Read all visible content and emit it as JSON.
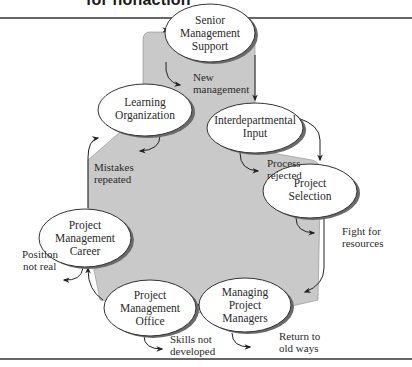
{
  "header": {
    "title_fragment": "for nonaction"
  },
  "colors": {
    "region_fill": "#c9c9c9",
    "rule": "#333333",
    "oval_fill": "#ffffff",
    "oval_stroke": "#333333",
    "shadow": "#6a6a6a"
  },
  "nodes": [
    {
      "id": "senior",
      "lines": [
        "Senior",
        "Management",
        "Support"
      ]
    },
    {
      "id": "interdepartmental",
      "lines": [
        "Interdepartmental",
        "Input"
      ]
    },
    {
      "id": "selection",
      "lines": [
        "Project",
        "Selection"
      ]
    },
    {
      "id": "managing",
      "lines": [
        "Managing",
        "Project",
        "Managers"
      ]
    },
    {
      "id": "pmo",
      "lines": [
        "Project",
        "Management",
        "Office"
      ]
    },
    {
      "id": "career",
      "lines": [
        "Project",
        "Management",
        "Career"
      ]
    },
    {
      "id": "learning",
      "lines": [
        "Learning",
        "Organization"
      ]
    }
  ],
  "failure_labels": [
    {
      "id": "new-management",
      "lines": [
        "New",
        "management"
      ]
    },
    {
      "id": "process-rejected",
      "lines": [
        "Process",
        "rejected"
      ]
    },
    {
      "id": "fight-for-resources",
      "lines": [
        "Fight for",
        "resources"
      ]
    },
    {
      "id": "return-to-old-ways",
      "lines": [
        "Return to",
        "old ways"
      ]
    },
    {
      "id": "skills-not-developed",
      "lines": [
        "Skills not",
        "developed"
      ]
    },
    {
      "id": "position-not-real",
      "lines": [
        "Position",
        "not real"
      ]
    },
    {
      "id": "mistakes-repeated",
      "lines": [
        "Mistakes",
        "repeated"
      ]
    }
  ]
}
